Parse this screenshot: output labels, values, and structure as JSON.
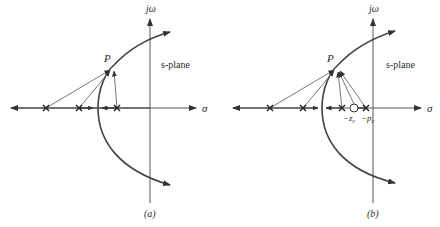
{
  "figure": {
    "panels": [
      {
        "id": "a",
        "caption": "(a)",
        "axis_labels": {
          "imag": "jω",
          "real": "σ"
        },
        "plane_label": "s-plane",
        "point_label": "P",
        "poles": 3,
        "zeros": 0,
        "pole_labels": []
      },
      {
        "id": "b",
        "caption": "(b)",
        "axis_labels": {
          "imag": "jω",
          "real": "σ"
        },
        "plane_label": "s-plane",
        "point_label": "P",
        "poles": 4,
        "zeros": 1,
        "compensator_labels": {
          "zero": "−z",
          "zero_sub": "c",
          "pole": "−p",
          "pole_sub": "c"
        }
      }
    ]
  }
}
